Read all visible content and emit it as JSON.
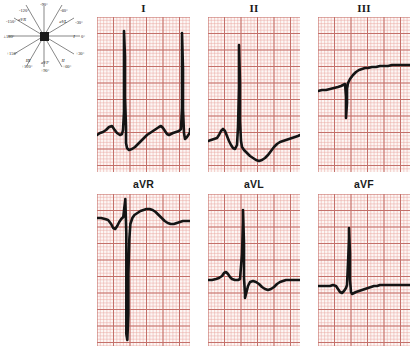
{
  "figure": {
    "type": "12-lead-ecg-limb-leads-with-hexaxial-reference",
    "paper_color": "#fdf7f5",
    "grid_color": "#e9a6a0",
    "grid_bold_color": "#c4706a",
    "trace_color": "#141414"
  },
  "hexaxial": {
    "name": "hexaxial-reference-system",
    "center_label": "",
    "axes": [
      {
        "lead": "I",
        "degrees": "0°",
        "label_deg": "I 0°",
        "angle": 0
      },
      {
        "lead": "II",
        "degrees": "+60°",
        "label_deg": "II +60°",
        "angle": 60
      },
      {
        "lead": "III",
        "degrees": "+120°",
        "label_deg": "III +120°",
        "angle": 120
      },
      {
        "lead": "aVR",
        "degrees": "-150°",
        "label_deg": "aVR -150°",
        "angle": -150
      },
      {
        "lead": "aVL",
        "degrees": "-30°",
        "label_deg": "aVL -30°",
        "angle": -30
      },
      {
        "lead": "aVF",
        "degrees": "+90°",
        "label_deg": "aVF +90°",
        "angle": 90
      }
    ],
    "tick_labels": [
      {
        "text": "-90°",
        "x": 44,
        "y": 5
      },
      {
        "text": "-120°",
        "x": 24,
        "y": 11
      },
      {
        "text": "-60°",
        "x": 64,
        "y": 11
      },
      {
        "text": "-150°",
        "x": 10,
        "y": 22
      },
      {
        "text": "-30°",
        "x": 78,
        "y": 23
      },
      {
        "text": "±180°",
        "x": 7,
        "y": 38
      },
      {
        "text": "0°",
        "x": 81,
        "y": 38
      },
      {
        "text": "+150°",
        "x": 11,
        "y": 54
      },
      {
        "text": "+30°",
        "x": 79,
        "y": 54
      },
      {
        "text": "+120°",
        "x": 26,
        "y": 66
      },
      {
        "text": "+60°",
        "x": 66,
        "y": 66
      },
      {
        "text": "+90°",
        "x": 45,
        "y": 70
      }
    ],
    "lead_labels": [
      {
        "text": "aVR",
        "x": 21,
        "y": 20
      },
      {
        "text": "aVL",
        "x": 63,
        "y": 22
      },
      {
        "text": "I",
        "x": 74,
        "y": 37
      },
      {
        "text": "III",
        "x": 27,
        "y": 61
      },
      {
        "text": "aVF",
        "x": 44,
        "y": 63
      },
      {
        "text": "II",
        "x": 62,
        "y": 61
      }
    ]
  },
  "leads": {
    "I": {
      "label": "I",
      "name": "lead-I"
    },
    "II": {
      "label": "II",
      "name": "lead-II"
    },
    "III": {
      "label": "III",
      "name": "lead-III"
    },
    "aVR": {
      "label": "aVR",
      "name": "lead-aVR"
    },
    "aVL": {
      "label": "aVL",
      "name": "lead-aVL"
    },
    "aVF": {
      "label": "aVF",
      "name": "lead-aVF"
    }
  },
  "chart_data": {
    "type": "line",
    "xlabel": "time",
    "ylabel": "amplitude (mV)",
    "grid": true,
    "legend": "none",
    "paper_speed": "25 mm/s",
    "calibration": "10 mm/mV",
    "series": [
      {
        "name": "I",
        "baseline_y": 116,
        "beats": [
          {
            "r_peak_y": 18,
            "s_trough_y": 132,
            "x": 27
          },
          {
            "r_peak_y": 18,
            "s_trough_y": 132,
            "x": 85
          }
        ],
        "points": [
          [
            0,
            118
          ],
          [
            3,
            116
          ],
          [
            6,
            115
          ],
          [
            9,
            113
          ],
          [
            12,
            110
          ],
          [
            15,
            109
          ],
          [
            17,
            112
          ],
          [
            20,
            116
          ],
          [
            23,
            118
          ],
          [
            25,
            117
          ],
          [
            26,
            113
          ],
          [
            27,
            95
          ],
          [
            27,
            60
          ],
          [
            27,
            24
          ],
          [
            27,
            14
          ],
          [
            28,
            40
          ],
          [
            28,
            80
          ],
          [
            29,
            110
          ],
          [
            29,
            126
          ],
          [
            30,
            131
          ],
          [
            32,
            133
          ],
          [
            35,
            132
          ],
          [
            38,
            130
          ],
          [
            41,
            127
          ],
          [
            44,
            124
          ],
          [
            47,
            121
          ],
          [
            50,
            118
          ],
          [
            53,
            116
          ],
          [
            56,
            114
          ],
          [
            59,
            112
          ],
          [
            62,
            110
          ],
          [
            64,
            109
          ],
          [
            66,
            111
          ],
          [
            68,
            114
          ],
          [
            70,
            117
          ],
          [
            72,
            118
          ],
          [
            74,
            117
          ],
          [
            76,
            116
          ],
          [
            79,
            115
          ],
          [
            82,
            114
          ],
          [
            84,
            112
          ],
          [
            85,
            90
          ],
          [
            85,
            50
          ],
          [
            85,
            22
          ],
          [
            85,
            16
          ],
          [
            86,
            52
          ],
          [
            86,
            92
          ],
          [
            87,
            116
          ],
          [
            88,
            122
          ],
          [
            90,
            120
          ],
          [
            92,
            117
          ],
          [
            93,
            115
          ],
          [
            93,
            112
          ]
        ]
      },
      {
        "name": "II",
        "baseline_y": 120,
        "beats": [
          {
            "r_peak_y": 28,
            "x": 31
          }
        ],
        "points": [
          [
            0,
            124
          ],
          [
            3,
            123
          ],
          [
            6,
            122
          ],
          [
            9,
            121
          ],
          [
            11,
            118
          ],
          [
            13,
            114
          ],
          [
            15,
            112
          ],
          [
            17,
            114
          ],
          [
            19,
            119
          ],
          [
            21,
            124
          ],
          [
            23,
            128
          ],
          [
            25,
            131
          ],
          [
            27,
            132
          ],
          [
            29,
            128
          ],
          [
            30,
            110
          ],
          [
            31,
            70
          ],
          [
            31,
            34
          ],
          [
            31,
            28
          ],
          [
            32,
            66
          ],
          [
            32,
            104
          ],
          [
            33,
            124
          ],
          [
            34,
            130
          ],
          [
            36,
            133
          ],
          [
            39,
            136
          ],
          [
            42,
            139
          ],
          [
            45,
            141
          ],
          [
            48,
            143
          ],
          [
            51,
            144
          ],
          [
            54,
            143
          ],
          [
            57,
            141
          ],
          [
            60,
            138
          ],
          [
            63,
            134
          ],
          [
            66,
            130
          ],
          [
            69,
            127
          ],
          [
            72,
            125
          ],
          [
            75,
            124
          ],
          [
            78,
            123
          ],
          [
            81,
            122
          ],
          [
            84,
            121
          ],
          [
            87,
            120
          ],
          [
            90,
            119
          ],
          [
            92,
            118
          ]
        ]
      },
      {
        "name": "III",
        "baseline_y": 70,
        "beats": [
          {
            "q_trough_y": 100,
            "x": 28
          }
        ],
        "points": [
          [
            0,
            74
          ],
          [
            4,
            73
          ],
          [
            8,
            73
          ],
          [
            12,
            72
          ],
          [
            16,
            71
          ],
          [
            20,
            70
          ],
          [
            23,
            69
          ],
          [
            25,
            68
          ],
          [
            27,
            67
          ],
          [
            28,
            80
          ],
          [
            28,
            96
          ],
          [
            28,
            101
          ],
          [
            29,
            86
          ],
          [
            29,
            72
          ],
          [
            30,
            66
          ],
          [
            32,
            62
          ],
          [
            35,
            58
          ],
          [
            38,
            55
          ],
          [
            41,
            53
          ],
          [
            44,
            52
          ],
          [
            47,
            51
          ],
          [
            50,
            51
          ],
          [
            54,
            50
          ],
          [
            58,
            50
          ],
          [
            62,
            49
          ],
          [
            66,
            49
          ],
          [
            70,
            49
          ],
          [
            74,
            48
          ],
          [
            78,
            48
          ],
          [
            82,
            48
          ],
          [
            86,
            48
          ],
          [
            90,
            48
          ],
          [
            92,
            48
          ]
        ]
      },
      {
        "name": "aVR",
        "baseline_y": 24,
        "beats": [
          {
            "r_peak_y": 5,
            "s_trough_y": 140,
            "x": 28
          }
        ],
        "points": [
          [
            0,
            24
          ],
          [
            4,
            24
          ],
          [
            8,
            25
          ],
          [
            11,
            26
          ],
          [
            14,
            30
          ],
          [
            16,
            34
          ],
          [
            18,
            35
          ],
          [
            20,
            32
          ],
          [
            22,
            28
          ],
          [
            24,
            25
          ],
          [
            26,
            23
          ],
          [
            27,
            14
          ],
          [
            28,
            6
          ],
          [
            28,
            5
          ],
          [
            29,
            40
          ],
          [
            29,
            80
          ],
          [
            29,
            120
          ],
          [
            29,
            140
          ],
          [
            30,
            146
          ],
          [
            31,
            120
          ],
          [
            31,
            80
          ],
          [
            32,
            45
          ],
          [
            33,
            30
          ],
          [
            35,
            24
          ],
          [
            37,
            21
          ],
          [
            40,
            19
          ],
          [
            43,
            17
          ],
          [
            46,
            16
          ],
          [
            49,
            15
          ],
          [
            52,
            15
          ],
          [
            55,
            16
          ],
          [
            58,
            18
          ],
          [
            61,
            21
          ],
          [
            64,
            24
          ],
          [
            67,
            27
          ],
          [
            70,
            29
          ],
          [
            73,
            30
          ],
          [
            76,
            30
          ],
          [
            79,
            29
          ],
          [
            82,
            28
          ],
          [
            85,
            27
          ],
          [
            88,
            27
          ],
          [
            92,
            27
          ]
        ]
      },
      {
        "name": "aVL",
        "baseline_y": 84,
        "beats": [
          {
            "r_peak_y": 16,
            "s_trough_y": 104,
            "x": 35
          }
        ],
        "points": [
          [
            0,
            86
          ],
          [
            4,
            86
          ],
          [
            8,
            85
          ],
          [
            11,
            84
          ],
          [
            14,
            82
          ],
          [
            16,
            79
          ],
          [
            18,
            78
          ],
          [
            20,
            80
          ],
          [
            22,
            83
          ],
          [
            24,
            85
          ],
          [
            27,
            86
          ],
          [
            30,
            86
          ],
          [
            32,
            85
          ],
          [
            34,
            60
          ],
          [
            35,
            28
          ],
          [
            35,
            17
          ],
          [
            35,
            16
          ],
          [
            36,
            50
          ],
          [
            36,
            84
          ],
          [
            37,
            100
          ],
          [
            37,
            104
          ],
          [
            38,
            100
          ],
          [
            40,
            92
          ],
          [
            42,
            88
          ],
          [
            45,
            87
          ],
          [
            48,
            88
          ],
          [
            51,
            90
          ],
          [
            54,
            93
          ],
          [
            57,
            95
          ],
          [
            60,
            96
          ],
          [
            63,
            95
          ],
          [
            66,
            93
          ],
          [
            69,
            90
          ],
          [
            72,
            88
          ],
          [
            75,
            87
          ],
          [
            78,
            86
          ],
          [
            82,
            86
          ],
          [
            86,
            86
          ],
          [
            90,
            86
          ],
          [
            92,
            86
          ]
        ]
      },
      {
        "name": "aVF",
        "baseline_y": 90,
        "beats": [
          {
            "r_peak_y": 34,
            "x": 31
          }
        ],
        "points": [
          [
            0,
            92
          ],
          [
            4,
            92
          ],
          [
            8,
            92
          ],
          [
            12,
            92
          ],
          [
            15,
            91
          ],
          [
            18,
            92
          ],
          [
            20,
            95
          ],
          [
            22,
            98
          ],
          [
            24,
            99
          ],
          [
            26,
            97
          ],
          [
            28,
            94
          ],
          [
            29,
            91
          ],
          [
            30,
            70
          ],
          [
            31,
            44
          ],
          [
            31,
            34
          ],
          [
            32,
            60
          ],
          [
            32,
            86
          ],
          [
            33,
            98
          ],
          [
            34,
            100
          ],
          [
            36,
            99
          ],
          [
            38,
            98
          ],
          [
            41,
            97
          ],
          [
            44,
            96
          ],
          [
            47,
            95
          ],
          [
            50,
            94
          ],
          [
            53,
            93
          ],
          [
            56,
            92
          ],
          [
            59,
            92
          ],
          [
            62,
            91
          ],
          [
            66,
            91
          ],
          [
            70,
            91
          ],
          [
            74,
            91
          ],
          [
            78,
            91
          ],
          [
            82,
            91
          ],
          [
            86,
            91
          ],
          [
            90,
            91
          ],
          [
            92,
            91
          ]
        ]
      }
    ]
  }
}
